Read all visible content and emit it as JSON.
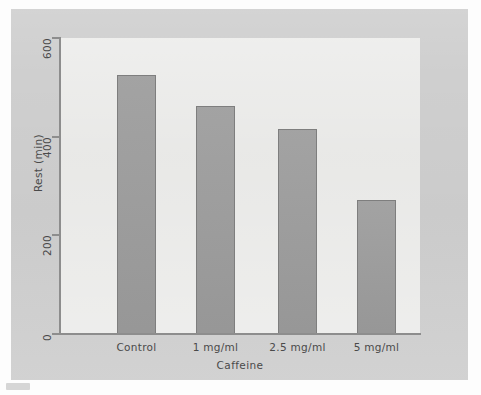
{
  "figure": {
    "panel_background": "#cfcfcf",
    "plot_background": "#e6e6e4",
    "axis_color": "#8d8d8d",
    "bar_fill": "#9d9d9d",
    "bar_edge": "#7e7e7e"
  },
  "chart_data": {
    "type": "bar",
    "title": "",
    "subtitle": "",
    "xlabel": "Caffeine",
    "ylabel": "Rest (min)",
    "categories": [
      "Control",
      "1 mg/ml",
      "2.5 mg/ml",
      "5 mg/ml"
    ],
    "values": [
      525,
      462,
      415,
      272
    ],
    "ylim": [
      0,
      600
    ],
    "yticks": [
      0,
      200,
      400,
      600
    ],
    "ytick_labels": [
      "0",
      "200",
      "400",
      "600"
    ],
    "ytick_label_rotation": -90,
    "xtick_labels": [
      "Control",
      "1 mg/ml",
      "2.5 mg/ml",
      "5 mg/ml"
    ],
    "grid": false,
    "legend": null,
    "legend_position": "none",
    "series": [
      {
        "name": "Rest (min)",
        "values": [
          525,
          462,
          415,
          272
        ]
      }
    ],
    "annotations": []
  }
}
